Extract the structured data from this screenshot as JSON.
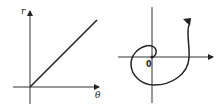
{
  "left_plot": {
    "title": "r vs theta (linear)",
    "y_axis_label": "r",
    "x_axis_label": "θ",
    "relation": "r = aθ",
    "colors": {
      "line": "#222222",
      "axis": "#333333"
    }
  },
  "right_plot": {
    "title": "Archimedean spiral (polar)",
    "origin_label": "0",
    "colors": {
      "curve": "#222222",
      "axis": "#333333"
    }
  }
}
